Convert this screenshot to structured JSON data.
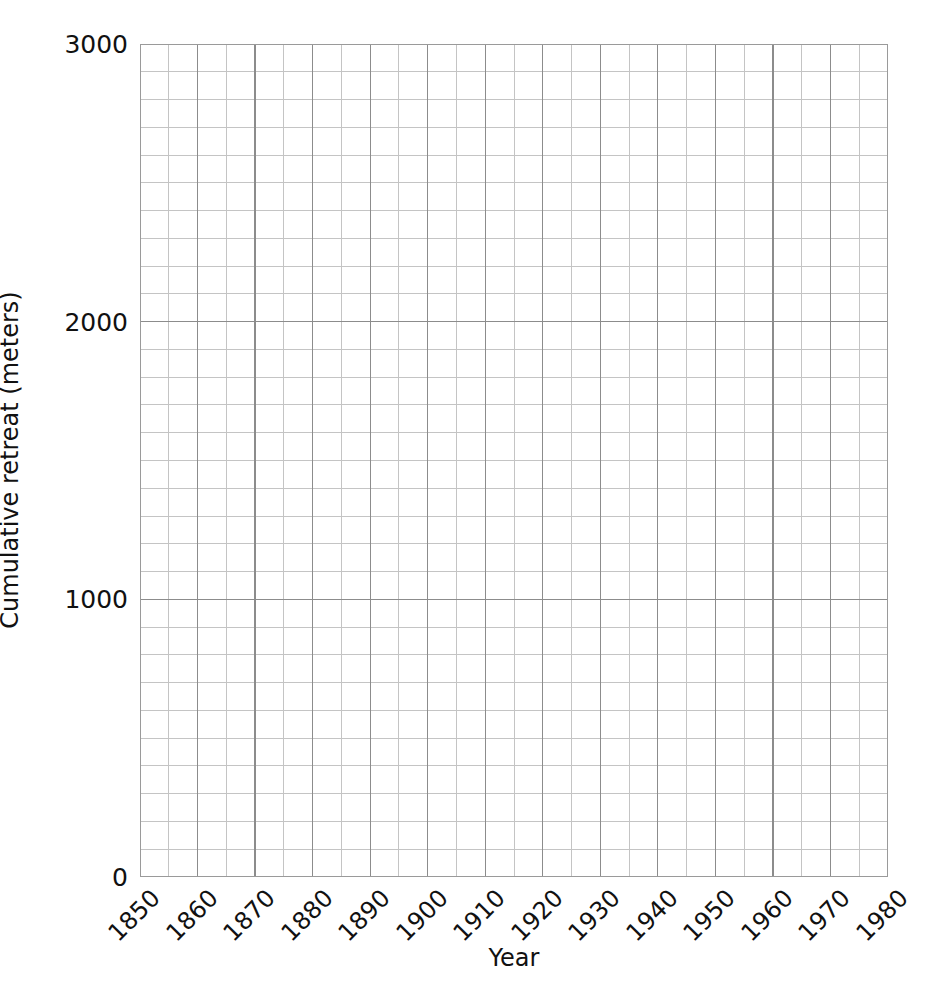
{
  "chart_data": {
    "type": "line",
    "title": "",
    "subtitle": "",
    "xlabel": "Year",
    "ylabel": "Cumulative retreat (meters)",
    "xlim": [
      1850,
      1980
    ],
    "ylim": [
      0,
      3000
    ],
    "x_major_ticks": [
      1850,
      1860,
      1870,
      1880,
      1890,
      1900,
      1910,
      1920,
      1930,
      1940,
      1950,
      1960,
      1970,
      1980
    ],
    "x_tick_labels": [
      "1850",
      "1860",
      "1870",
      "1880",
      "1890",
      "1900",
      "1910",
      "1920",
      "1930",
      "1940",
      "1950",
      "1960",
      "1970",
      "1980"
    ],
    "x_minor_step": 5,
    "y_major_ticks": [
      0,
      1000,
      2000,
      3000
    ],
    "y_tick_labels": [
      "0",
      "1000",
      "2000",
      "3000"
    ],
    "y_minor_step": 100,
    "grid": true,
    "grid_major_color": "#8c8c8c",
    "grid_minor_color": "#c4c4c4",
    "axis_color": "#9a9a9a",
    "background": "#ffffff",
    "series": [],
    "data_points": [],
    "annotations": [],
    "legend": null,
    "legend_position": "none",
    "note": "Empty plotting grid: axes and gridlines drawn, no data series plotted."
  },
  "axes": {
    "x": {
      "label": "Year",
      "ticks": [
        {
          "value": 1850,
          "label": "1850"
        },
        {
          "value": 1860,
          "label": "1860"
        },
        {
          "value": 1870,
          "label": "1870"
        },
        {
          "value": 1880,
          "label": "1880"
        },
        {
          "value": 1890,
          "label": "1890"
        },
        {
          "value": 1900,
          "label": "1900"
        },
        {
          "value": 1910,
          "label": "1910"
        },
        {
          "value": 1920,
          "label": "1920"
        },
        {
          "value": 1930,
          "label": "1930"
        },
        {
          "value": 1940,
          "label": "1940"
        },
        {
          "value": 1950,
          "label": "1950"
        },
        {
          "value": 1960,
          "label": "1960"
        },
        {
          "value": 1970,
          "label": "1970"
        },
        {
          "value": 1980,
          "label": "1980"
        }
      ],
      "tick_label_rotation_deg": -45
    },
    "y": {
      "label": "Cumulative retreat (meters)",
      "ticks": [
        {
          "value": 3000,
          "label": "3000"
        },
        {
          "value": 2000,
          "label": "2000"
        },
        {
          "value": 1000,
          "label": "1000"
        },
        {
          "value": 0,
          "label": "0"
        }
      ]
    }
  }
}
